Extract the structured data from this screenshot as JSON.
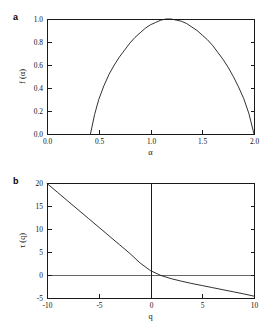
{
  "figure": {
    "background": "#ffffff",
    "line_color": "#1a1a1a",
    "zero_line_color": "#555555"
  },
  "panels": [
    {
      "label": "a",
      "xlabel": "α",
      "ylabel": "f (α)",
      "xticks": [
        "0.0",
        "0.5",
        "1.0",
        "1.5",
        "2.0"
      ],
      "yticks": [
        "0.0",
        "0.2",
        "0.4",
        "0.6",
        "0.8",
        "1.0"
      ]
    },
    {
      "label": "b",
      "xlabel": "q",
      "ylabel": "τ (q)",
      "xticks": [
        "-10",
        "-5",
        "0",
        "5",
        "10"
      ],
      "yticks": [
        "-5",
        "0",
        "5",
        "10",
        "15",
        "20"
      ]
    }
  ],
  "chart_data": [
    {
      "type": "line",
      "title": "",
      "panel": "a",
      "xlabel": "α",
      "ylabel": "f (α)",
      "xlim": [
        0.0,
        2.0
      ],
      "ylim": [
        0.0,
        1.0
      ],
      "xticks": [
        0.0,
        0.5,
        1.0,
        1.5,
        2.0
      ],
      "yticks": [
        0.0,
        0.2,
        0.4,
        0.6,
        0.8,
        1.0
      ],
      "grid": false,
      "legend": "none",
      "series": [
        {
          "name": "f(alpha)",
          "x": [
            0.42,
            0.46,
            0.5,
            0.55,
            0.6,
            0.65,
            0.7,
            0.75,
            0.8,
            0.85,
            0.9,
            0.95,
            1.0,
            1.05,
            1.1,
            1.15,
            1.2,
            1.25,
            1.3,
            1.35,
            1.4,
            1.45,
            1.5,
            1.55,
            1.6,
            1.65,
            1.7,
            1.75,
            1.8,
            1.85,
            1.9,
            1.95,
            2.0
          ],
          "y": [
            0.0,
            0.17,
            0.3,
            0.42,
            0.52,
            0.6,
            0.67,
            0.73,
            0.79,
            0.84,
            0.88,
            0.92,
            0.95,
            0.97,
            0.99,
            1.0,
            1.0,
            0.99,
            0.98,
            0.96,
            0.93,
            0.9,
            0.86,
            0.82,
            0.77,
            0.71,
            0.65,
            0.58,
            0.5,
            0.41,
            0.31,
            0.18,
            0.0
          ]
        }
      ]
    },
    {
      "type": "line",
      "title": "",
      "panel": "b",
      "xlabel": "q",
      "ylabel": "τ (q)",
      "xlim": [
        -10,
        10
      ],
      "ylim": [
        -5,
        20
      ],
      "xticks": [
        -10,
        -5,
        0,
        5,
        10
      ],
      "yticks": [
        -5,
        0,
        5,
        10,
        15,
        20
      ],
      "grid": false,
      "legend": "none",
      "reference_lines": [
        {
          "name": "tau-zero-horizontal",
          "axis": "y",
          "value": 0
        },
        {
          "name": "q-zero-vertical",
          "axis": "x",
          "value": 0
        }
      ],
      "series": [
        {
          "name": "tau(q)",
          "x": [
            -10,
            -9,
            -8,
            -7,
            -6,
            -5,
            -4,
            -3,
            -2,
            -1,
            0,
            1,
            2,
            3,
            4,
            5,
            6,
            7,
            8,
            9,
            10
          ],
          "y": [
            19.9,
            18.0,
            16.1,
            14.2,
            12.3,
            10.4,
            8.5,
            6.6,
            4.7,
            2.6,
            0.95,
            -0.1,
            -0.8,
            -1.35,
            -1.85,
            -2.3,
            -2.75,
            -3.2,
            -3.65,
            -4.1,
            -4.6
          ]
        }
      ]
    }
  ]
}
